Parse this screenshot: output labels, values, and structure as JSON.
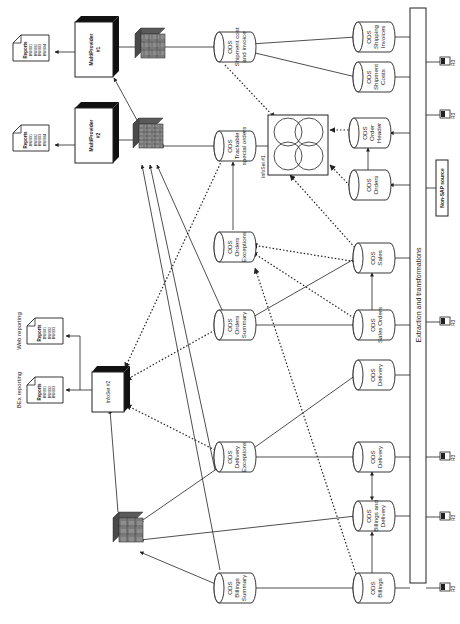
{
  "header_fragment": "",
  "colors": {
    "line": "#222222",
    "cube_face": "#7a7a7a",
    "cube_dark": "#4a4a4a",
    "box_shadow": "#1a1a1a",
    "background": "#ffffff"
  },
  "bus": {
    "label": "Extraction and transformations",
    "x": 410,
    "y": 8,
    "w": 16,
    "h": 575
  },
  "non_sap_source": {
    "label": "Non-SAP source",
    "x": 435,
    "y": 160,
    "w": 13,
    "h": 55
  },
  "r3_sources": [
    {
      "label": "R3",
      "y": 62
    },
    {
      "label": "R3",
      "y": 115
    },
    {
      "label": "R3",
      "y": 322
    },
    {
      "label": "R3",
      "y": 457
    },
    {
      "label": "R3",
      "y": 517
    },
    {
      "label": "R3",
      "y": 588
    }
  ],
  "ods_sources": [
    {
      "id": "shipping-invoices",
      "lines": [
        "ODS",
        "Shipping",
        "Invoices"
      ],
      "cx": 372,
      "cy": 37
    },
    {
      "id": "shipment-costs",
      "lines": [
        "ODS",
        "Shipment",
        "Costs"
      ],
      "cx": 372,
      "cy": 77
    },
    {
      "id": "order-header",
      "lines": [
        "ODS",
        "Order",
        "Header"
      ],
      "cx": 368,
      "cy": 133
    },
    {
      "id": "orders",
      "lines": [
        "ODS",
        "Orders"
      ],
      "cx": 368,
      "cy": 185
    },
    {
      "id": "sales",
      "lines": [
        "ODS",
        "Sales"
      ],
      "cx": 372,
      "cy": 258
    },
    {
      "id": "sales-orders",
      "lines": [
        "ODS",
        "Sales Orders"
      ],
      "cx": 372,
      "cy": 325
    },
    {
      "id": "delivery-1",
      "lines": [
        "ODS",
        "Delivery"
      ],
      "cx": 372,
      "cy": 375
    },
    {
      "id": "delivery-2",
      "lines": [
        "ODS",
        "Delivery"
      ],
      "cx": 372,
      "cy": 457
    },
    {
      "id": "billings-delivery",
      "lines": [
        "ODS",
        "Billings and",
        "Delivery"
      ],
      "cx": 372,
      "cy": 516
    },
    {
      "id": "billings",
      "lines": [
        "ODS",
        "Billings"
      ],
      "cx": 372,
      "cy": 588
    }
  ],
  "ods_middle": [
    {
      "id": "shipment-cost-invoice",
      "lines": [
        "ODS",
        "Shipment cost",
        "and invoice"
      ],
      "cx": 233,
      "cy": 47
    },
    {
      "id": "trackable-special-orders",
      "lines": [
        "ODS",
        "Trackable",
        "special orders"
      ],
      "cx": 233,
      "cy": 146
    },
    {
      "id": "orders-exceptions",
      "lines": [
        "ODS",
        "Orders",
        "Exceptions"
      ],
      "cx": 233,
      "cy": 247
    },
    {
      "id": "orders-summary",
      "lines": [
        "ODS",
        "Orders",
        "Summary"
      ],
      "cx": 233,
      "cy": 325
    },
    {
      "id": "delivery-exceptions",
      "lines": [
        "ODS",
        "Delivery",
        "Exceptions"
      ],
      "cx": 233,
      "cy": 457
    },
    {
      "id": "billings-summary",
      "lines": [
        "ODS",
        "Billings",
        "Summary"
      ],
      "cx": 233,
      "cy": 588
    }
  ],
  "infoset1": {
    "label": "InfoSet #1",
    "x": 268,
    "y": 115,
    "w": 60,
    "h": 60
  },
  "infoset2": {
    "label": "InfoSet #2",
    "x": 92,
    "y": 368,
    "w": 32,
    "h": 40
  },
  "multiproviders": [
    {
      "id": "mp1",
      "label": "MultiProvider",
      "sub": "#1",
      "x": 75,
      "y": 22,
      "w": 38,
      "h": 55
    },
    {
      "id": "mp2",
      "label": "MultiProvider",
      "sub": "#2",
      "x": 75,
      "y": 108,
      "w": 38,
      "h": 55
    }
  ],
  "cubes": [
    {
      "id": "cube-top",
      "x": 135,
      "y": 28
    },
    {
      "id": "cube-mid",
      "x": 133,
      "y": 118
    },
    {
      "id": "cube-bottom",
      "x": 113,
      "y": 512
    }
  ],
  "reports": [
    {
      "id": "report-mp1",
      "title": "Reports",
      "items": [
        "BW001",
        "BW002",
        "BW003",
        "BW004"
      ],
      "x": 13,
      "y": 35
    },
    {
      "id": "report-mp2",
      "title": "Reports",
      "items": [
        "BW001",
        "BW002",
        "BW003",
        "BW004"
      ],
      "x": 13,
      "y": 125
    },
    {
      "id": "report-web",
      "title": "Reports",
      "items": [
        "BW001",
        "BW002",
        "BW003"
      ],
      "x": 27,
      "y": 318,
      "caption": "Web reporting"
    },
    {
      "id": "report-bex",
      "title": "Reports",
      "items": [
        "BW001",
        "BW002",
        "BW003"
      ],
      "x": 27,
      "y": 377,
      "caption": "BEx reporting"
    }
  ]
}
